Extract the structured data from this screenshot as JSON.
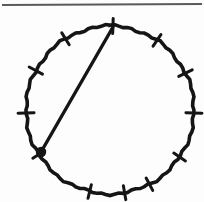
{
  "figure": {
    "background_color": "#fdfdfd",
    "ink_color": "#151515",
    "rule_color": "#5a5a5a",
    "canvas": {
      "width": 204,
      "height": 202
    },
    "top_rule": {
      "name": "horizontal-rule",
      "x1": 2,
      "y1": 5,
      "x2": 202,
      "y2": 4,
      "stroke_width": 2.2
    },
    "circle": {
      "name": "main-circle",
      "center_x": 110,
      "center_y": 110,
      "radius": 84,
      "stroke_width": 3.6
    },
    "chord": {
      "name": "chord-segment",
      "from_label": "top-vertex",
      "to_label": "dot-vertex",
      "x1": 113,
      "y1": 27,
      "x2": 41,
      "y2": 152,
      "stroke_width": 3.4
    },
    "node": {
      "name": "filled-vertex-dot",
      "cx": 41,
      "cy": 152,
      "r": 5.2
    },
    "tick_count": 12,
    "tick_length": 15,
    "ticks": [
      {
        "label": "tick-12-oclock",
        "angle_deg": -88,
        "length": 15
      },
      {
        "label": "tick-1-oclock",
        "angle_deg": -56,
        "length": 14
      },
      {
        "label": "tick-2-oclock",
        "angle_deg": -26,
        "length": 15
      },
      {
        "label": "tick-3-oclock",
        "angle_deg": 2,
        "length": 16
      },
      {
        "label": "tick-4-oclock",
        "angle_deg": 34,
        "length": 14
      },
      {
        "label": "tick-5-oclock",
        "angle_deg": 62,
        "length": 14
      },
      {
        "label": "tick-6-oclock",
        "angle_deg": 80,
        "length": 14
      },
      {
        "label": "tick-7-oclock",
        "angle_deg": 104,
        "length": 14
      },
      {
        "label": "tick-8-oclock",
        "angle_deg": 148,
        "length": 14
      },
      {
        "label": "tick-9-oclock",
        "angle_deg": 178,
        "length": 16
      },
      {
        "label": "tick-10-oclock",
        "angle_deg": 208,
        "length": 15
      },
      {
        "label": "tick-11-oclock",
        "angle_deg": 238,
        "length": 14
      }
    ]
  }
}
